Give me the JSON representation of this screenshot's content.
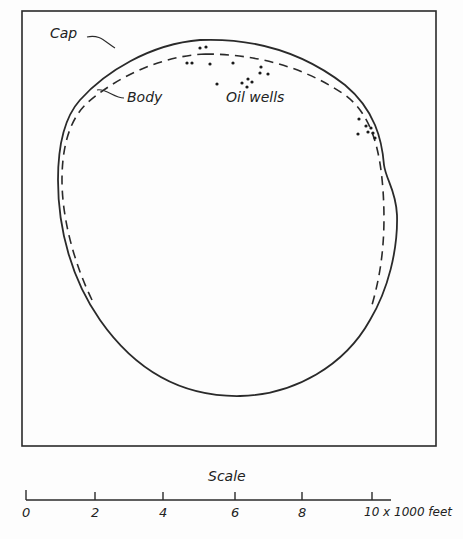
{
  "diagram": {
    "labels": {
      "cap": "Cap",
      "body": "Body",
      "oil_wells": "Oil wells"
    },
    "scale": {
      "title": "Scale",
      "ticks": [
        "0",
        "2",
        "4",
        "6",
        "8",
        "10 x 1000 feet"
      ]
    },
    "colors": {
      "ink": "#2a2a2a",
      "background": "#fdfdfd"
    }
  }
}
